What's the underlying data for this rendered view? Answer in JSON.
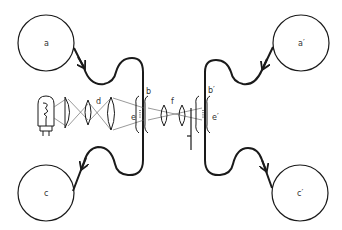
{
  "diagram": {
    "colors": {
      "stroke": "#1a1a1a",
      "background": "#ffffff",
      "label": "#333333"
    },
    "reels": [
      {
        "id": "a",
        "label": "a",
        "position": "top-left"
      },
      {
        "id": "a_prime",
        "label": "a′",
        "position": "top-right"
      },
      {
        "id": "c",
        "label": "c",
        "position": "bottom-left"
      },
      {
        "id": "c_prime",
        "label": "c′",
        "position": "bottom-right"
      }
    ],
    "labels": {
      "b": "b",
      "b_prime": "b′",
      "d": "d",
      "e": "e",
      "e_prime": "e′",
      "f": "f"
    },
    "components": [
      {
        "id": "lamp",
        "name": "light source (lamp)"
      },
      {
        "id": "condenser",
        "name": "condenser lens"
      },
      {
        "id": "lens-d",
        "name": "lens d"
      },
      {
        "id": "gate-b",
        "name": "film gate b"
      },
      {
        "id": "aperture-e",
        "name": "aperture e"
      },
      {
        "id": "lenses-f",
        "name": "relay lenses f"
      },
      {
        "id": "gate-b-prime",
        "name": "film gate b′"
      },
      {
        "id": "aperture-e-prime",
        "name": "aperture e′"
      }
    ]
  }
}
